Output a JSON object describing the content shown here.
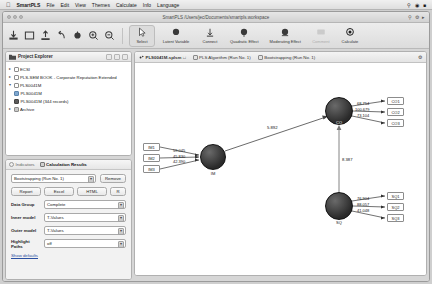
{
  "menubar": {
    "apple": "",
    "app_name": "SmartPLS",
    "items": [
      "File",
      "Edit",
      "View",
      "Themes",
      "Calculate",
      "Info",
      "Language"
    ],
    "right_icons": [
      "search-icon",
      "wifi-icon",
      "battery-icon"
    ]
  },
  "window": {
    "title": "SmartPLS /Users/jec/Documents/smartpls.workspace",
    "traffic_lights": [
      "close",
      "minimize",
      "zoom"
    ]
  },
  "toolbar": {
    "icon_buttons": [
      "import-icon",
      "new-project-icon",
      "export-icon",
      "undo-icon",
      "redo-icon",
      "zoom-in-icon",
      "zoom-out-icon"
    ],
    "buttons": [
      {
        "label": "Select",
        "name": "select-tool",
        "state": "selected"
      },
      {
        "label": "Latent Variable",
        "name": "latent-variable-tool",
        "state": "normal"
      },
      {
        "label": "Connect",
        "name": "connect-tool",
        "state": "normal"
      },
      {
        "label": "Quadratic Effect",
        "name": "quadratic-effect-tool",
        "state": "normal"
      },
      {
        "label": "Moderating Effect",
        "name": "moderating-effect-tool",
        "state": "normal"
      },
      {
        "label": "Comment",
        "name": "comment-tool",
        "state": "disabled"
      },
      {
        "label": "Calculate",
        "name": "calculate-tool",
        "state": "normal"
      }
    ]
  },
  "explorer": {
    "title": "Project Explorer",
    "header_buttons": [
      "collapse-all-icon",
      "expand-all-icon",
      "menu-icon"
    ],
    "nodes": [
      {
        "label": "ECSI",
        "level": 0,
        "arrow": "▸",
        "icon": "folder-white"
      },
      {
        "label": "PLS-SEM BOOK - Corporate Reputation Extended",
        "level": 0,
        "arrow": "▸",
        "icon": "folder-white"
      },
      {
        "label": "PLS0041M",
        "level": 0,
        "arrow": "▾",
        "icon": "folder-white"
      },
      {
        "label": "PLS0041M",
        "level": 1,
        "arrow": "",
        "icon": "model-blue"
      },
      {
        "label": "PLS0041M (344 records)",
        "level": 1,
        "arrow": "",
        "icon": "data-dark"
      },
      {
        "label": "Archive",
        "level": 0,
        "arrow": "▸",
        "icon": "folder-grey"
      }
    ]
  },
  "results_panel": {
    "tabs": [
      {
        "label": "Indicators",
        "name": "tab-indicators",
        "active": false,
        "icon": "circle-icon"
      },
      {
        "label": "Calculation Results",
        "name": "tab-calculation-results",
        "active": true,
        "icon": "table-icon"
      }
    ],
    "run_select": {
      "value": "Bootstrapping (Run No. 1)",
      "name": "run-select"
    },
    "remove_label": "Remove",
    "export_buttons": [
      "Report",
      "Excel",
      "HTML",
      "R"
    ],
    "fields": [
      {
        "label": "Data Group",
        "value": "Complete",
        "name": "data-group-select"
      },
      {
        "label": "Inner model",
        "value": "T-Values",
        "name": "inner-model-select"
      },
      {
        "label": "Outer model",
        "value": "T-Values",
        "name": "outer-model-select"
      },
      {
        "label": "Highlight Paths",
        "value": "off",
        "name": "highlight-paths-select"
      }
    ],
    "show_defaults": "Show defaults"
  },
  "editor": {
    "tabs": [
      {
        "label": "PLS0041M.splsm",
        "name": "tab-model-file",
        "active": true,
        "modified": "□"
      },
      {
        "label": "PLS Algorithm (Run No. 1)",
        "name": "tab-pls-algorithm",
        "active": false
      },
      {
        "label": "Bootstrapping (Run No. 1)",
        "name": "tab-bootstrapping",
        "active": false
      }
    ],
    "settings_icon": "gear-icon"
  },
  "model": {
    "constructs": [
      {
        "id": "IM",
        "label": "IM",
        "cx": 78,
        "cy": 94,
        "r": 13
      },
      {
        "id": "CO",
        "label": "CO",
        "cx": 204,
        "cy": 48,
        "r": 14
      },
      {
        "id": "SQ",
        "label": "SQ",
        "cx": 204,
        "cy": 143,
        "r": 14
      }
    ],
    "indicators": [
      {
        "id": "IM1",
        "label": "IM1",
        "construct": "IM",
        "value": "59.045",
        "side": "left",
        "x": 8,
        "y": 80
      },
      {
        "id": "IM2",
        "label": "IM2",
        "construct": "IM",
        "value": "45.830",
        "side": "left",
        "x": 8,
        "y": 91
      },
      {
        "id": "IM3",
        "label": "IM3",
        "construct": "IM",
        "value": "42.390",
        "side": "left",
        "x": 8,
        "y": 102
      },
      {
        "id": "CO1",
        "label": "CO1",
        "construct": "CO",
        "value": "68.754",
        "side": "right",
        "x": 252,
        "y": 34
      },
      {
        "id": "CO2",
        "label": "CO2",
        "construct": "CO",
        "value": "100.679",
        "side": "right",
        "x": 252,
        "y": 45
      },
      {
        "id": "CO3",
        "label": "CO3",
        "construct": "CO",
        "value": "73.104",
        "side": "right",
        "x": 252,
        "y": 56
      },
      {
        "id": "SQ1",
        "label": "SQ1",
        "construct": "SQ",
        "value": "76.904",
        "side": "right",
        "x": 252,
        "y": 129
      },
      {
        "id": "SQ2",
        "label": "SQ2",
        "construct": "SQ",
        "value": "88.057",
        "side": "right",
        "x": 252,
        "y": 140
      },
      {
        "id": "SQ3",
        "label": "SQ3",
        "construct": "SQ",
        "value": "41.048",
        "side": "right",
        "x": 252,
        "y": 151
      }
    ],
    "paths": [
      {
        "from": "IM",
        "to": "CO",
        "value": "5.892"
      },
      {
        "from": "SQ",
        "to": "CO",
        "value": "8.387"
      }
    ]
  }
}
